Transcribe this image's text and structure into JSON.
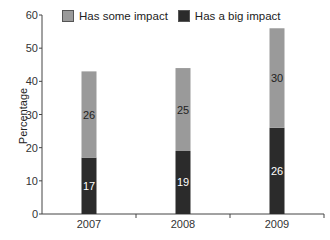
{
  "chart_data": {
    "type": "bar",
    "stacked": true,
    "title": "",
    "xlabel": "",
    "ylabel": "Percentage",
    "ylim": [
      0,
      60
    ],
    "yticks": [
      0,
      10,
      20,
      30,
      40,
      50,
      60
    ],
    "categories": [
      "2007",
      "2008",
      "2009"
    ],
    "series": [
      {
        "name": "Has a big impact",
        "values": [
          17,
          19,
          26
        ],
        "color": "#2b2b2b"
      },
      {
        "name": "Has some impact",
        "values": [
          26,
          25,
          30
        ],
        "color": "#9a9a9a"
      }
    ],
    "legend": [
      "Has some impact",
      "Has a big impact"
    ],
    "legend_position": "top",
    "grid": false
  },
  "legend": {
    "some_label": "Has some impact",
    "big_label": "Has a big impact",
    "some_color": "#9a9a9a",
    "big_color": "#2b2b2b"
  },
  "axis": {
    "ylabel": "Percentage"
  }
}
